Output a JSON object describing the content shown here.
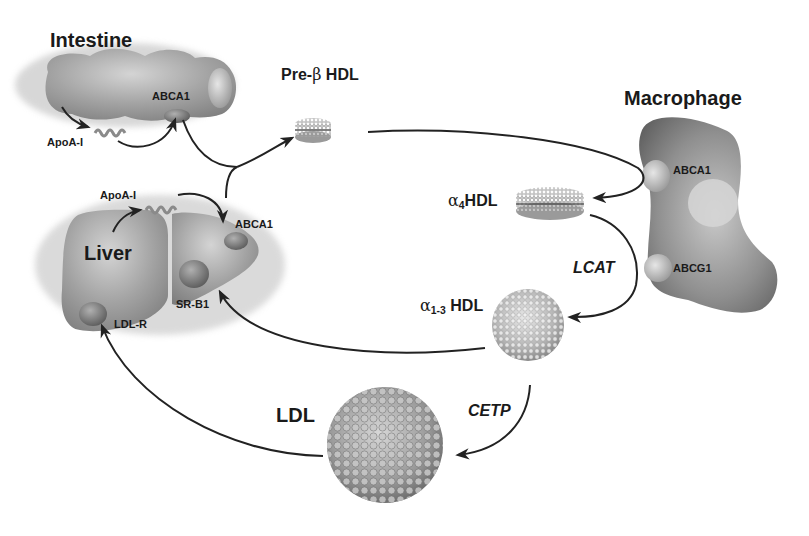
{
  "diagram": {
    "type": "flow",
    "nodes": {
      "intestine": {
        "label": "Intestine",
        "receptors": [
          "ABCA1"
        ],
        "secretes": "ApoA-I"
      },
      "liver": {
        "label": "Liver",
        "receptors": [
          "ABCA1",
          "SR-B1",
          "LDL-R"
        ],
        "secretes": "ApoA-I"
      },
      "macrophage": {
        "label": "Macrophage",
        "receptors": [
          "ABCA1",
          "ABCG1"
        ]
      },
      "pre_beta_hdl": {
        "label_prefix": "Pre-",
        "label_greek": "β",
        "label_suffix": " HDL"
      },
      "alpha4_hdl": {
        "greek": "α",
        "sub": "4",
        "suffix": "HDL"
      },
      "alpha13_hdl": {
        "greek": "α",
        "sub": "1-3",
        "suffix": " HDL"
      },
      "ldl": {
        "label": "LDL"
      }
    },
    "enzymes": {
      "lcat": "LCAT",
      "cetp": "CETP"
    },
    "labels": {
      "intestine_abca1": "ABCA1",
      "intestine_apoa1": "ApoA-I",
      "liver_apoa1": "ApoA-I",
      "liver_abca1": "ABCA1",
      "liver_srb1": "SR-B1",
      "liver_ldlr": "LDL-R",
      "macrophage_abca1": "ABCA1",
      "macrophage_abcg1": "ABCG1"
    },
    "edges": [
      {
        "from": "intestine",
        "to": "ApoA-I",
        "label": ""
      },
      {
        "from": "ApoA-I (intestine)",
        "to": "intestine ABCA1",
        "label": ""
      },
      {
        "from": "intestine ABCA1",
        "to": "pre_beta_hdl",
        "label": ""
      },
      {
        "from": "liver",
        "to": "ApoA-I (liver)",
        "label": ""
      },
      {
        "from": "ApoA-I (liver)",
        "to": "liver ABCA1",
        "label": ""
      },
      {
        "from": "liver ABCA1",
        "to": "pre_beta_hdl",
        "label": ""
      },
      {
        "from": "pre_beta_hdl",
        "to": "macrophage ABCA1 -> alpha4_hdl",
        "label": ""
      },
      {
        "from": "alpha4_hdl",
        "to": "alpha13_hdl",
        "label": "LCAT"
      },
      {
        "from": "alpha13_hdl",
        "to": "liver SR-B1",
        "label": ""
      },
      {
        "from": "alpha13_hdl",
        "to": "ldl",
        "label": "CETP"
      },
      {
        "from": "ldl",
        "to": "liver LDL-R",
        "label": ""
      }
    ],
    "colors": {
      "background": "#ffffff",
      "organ": "#9a9a9a",
      "organ_dark": "#6e6e6e",
      "text": "#1a1a1a",
      "arrow": "#222222"
    }
  }
}
